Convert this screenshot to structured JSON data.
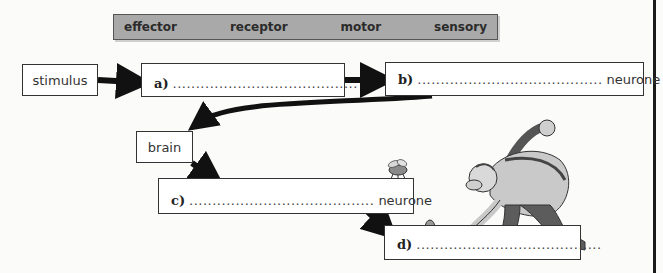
{
  "word_bank": {
    "words": [
      "effector",
      "receptor",
      "motor",
      "sensory"
    ]
  },
  "flow": {
    "stimulus": "stimulus",
    "brain": "brain",
    "a": {
      "letter": "a)",
      "blank": "........................................",
      "suffix": ""
    },
    "b": {
      "letter": "b)",
      "blank": "........................................",
      "suffix": "neurone"
    },
    "c": {
      "letter": "c)",
      "blank": "........................................",
      "suffix": "neurone"
    },
    "d": {
      "letter": "d)",
      "blank": "........................................",
      "suffix": ""
    }
  },
  "illustrations": {
    "insect": "fly-on-box",
    "character": "man-swatting-with-rolled-newspaper"
  }
}
